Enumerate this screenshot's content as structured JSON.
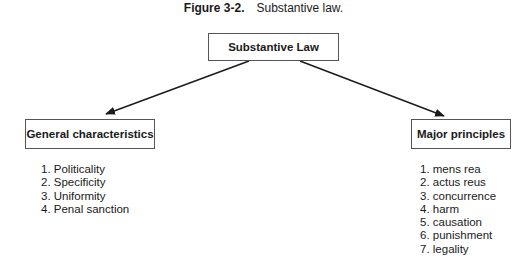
{
  "caption": {
    "figure_label": "Figure 3-2.",
    "title": "Substantive law."
  },
  "diagram": {
    "root": {
      "label": "Substantive Law"
    },
    "branches": [
      {
        "label": "General characteristics",
        "items": [
          "1. Politicality",
          "2. Specificity",
          "3. Uniformity",
          "4. Penal sanction"
        ]
      },
      {
        "label": "Major principles",
        "items": [
          "1. mens rea",
          "2. actus reus",
          "3. concurrence",
          "4. harm",
          "5. causation",
          "6. punishment",
          "7. legality"
        ]
      }
    ],
    "edges": [
      {
        "from": "Substantive Law",
        "to": "General characteristics"
      },
      {
        "from": "Substantive Law",
        "to": "Major principles"
      }
    ],
    "colors": {
      "line": "#1a1a1a",
      "box_border": "#555555"
    }
  }
}
